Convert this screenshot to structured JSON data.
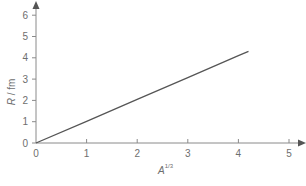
{
  "chart_data": {
    "type": "line",
    "title": "",
    "xlabel": "A^(1/3)",
    "ylabel": "R / fm",
    "xlim": [
      0,
      5
    ],
    "ylim": [
      0,
      6
    ],
    "x_ticks": [
      "0",
      "1",
      "2",
      "3",
      "4",
      "5"
    ],
    "y_ticks": [
      "0",
      "1",
      "2",
      "3",
      "4",
      "5",
      "6"
    ],
    "grid": false,
    "legend": null,
    "series": [
      {
        "name": "R vs A^(1/3)",
        "x": [
          0,
          1,
          2,
          3,
          4,
          4.2
        ],
        "y": [
          0,
          1.02,
          2.05,
          3.07,
          4.1,
          4.3
        ]
      }
    ]
  },
  "axes": {
    "y_label_main": "R",
    "y_label_unit": " / fm",
    "x_label_main": "A",
    "x_label_sup": "1/3"
  }
}
